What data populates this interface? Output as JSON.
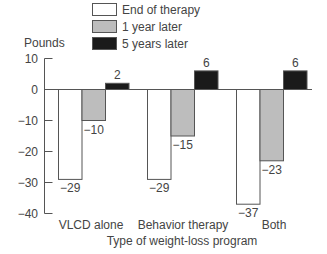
{
  "chart_data": {
    "type": "bar",
    "title": "",
    "ylabel": "Pounds",
    "xlabel": "Type of weight-loss program",
    "ylim": [
      -40,
      10
    ],
    "yticks": [
      10,
      0,
      -10,
      -20,
      -30,
      -40
    ],
    "ytick_labels": [
      "10",
      "0",
      "−10",
      "−20",
      "−30",
      "−40"
    ],
    "categories": [
      "VLCD alone",
      "Behavior therapy",
      "Both"
    ],
    "series": [
      {
        "name": "End of therapy",
        "color": "#ffffff",
        "values": [
          -29,
          -29,
          -37
        ],
        "labels": [
          "−29",
          "−29",
          "−37"
        ]
      },
      {
        "name": "1 year later",
        "color": "#bdbdbd",
        "values": [
          -10,
          -15,
          -23
        ],
        "labels": [
          "−10",
          "−15",
          "−23"
        ]
      },
      {
        "name": "5 years later",
        "color": "#1a1a1a",
        "values": [
          2,
          6,
          6
        ],
        "labels": [
          "2",
          "6",
          "6"
        ]
      }
    ],
    "grid": false,
    "legend_position": "top"
  }
}
